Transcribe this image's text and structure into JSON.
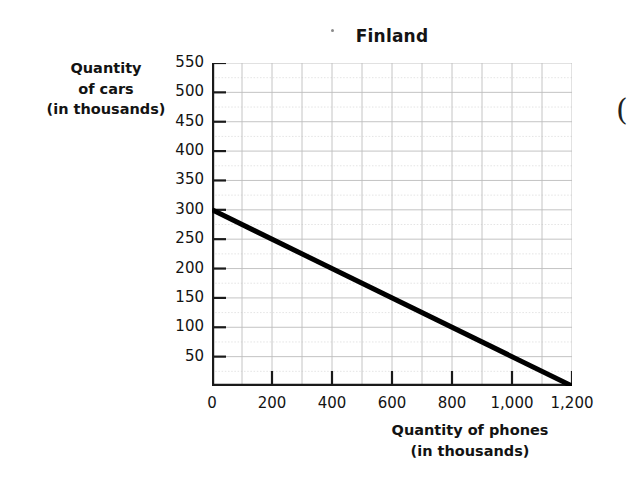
{
  "chart_data": {
    "type": "line",
    "title": "Finland",
    "xlabel": "Quantity of phones (in thousands)",
    "ylabel": "Quantity of cars (in thousands)",
    "xlabel_lines": [
      "Quantity of phones",
      "(in thousands)"
    ],
    "ylabel_lines": [
      "Quantity",
      "of cars",
      "(in thousands)"
    ],
    "xlim": [
      0,
      1200
    ],
    "ylim": [
      0,
      550
    ],
    "x_tick_values": [
      0,
      200,
      400,
      600,
      800,
      1000,
      1200
    ],
    "x_tick_labels": [
      "0",
      "200",
      "400",
      "600",
      "800",
      "1,000",
      "1,200"
    ],
    "y_tick_values": [
      50,
      100,
      150,
      200,
      250,
      300,
      350,
      400,
      450,
      500,
      550
    ],
    "y_tick_labels": [
      "50",
      "100",
      "150",
      "200",
      "250",
      "300",
      "350",
      "400",
      "450",
      "500",
      "550"
    ],
    "grid": true,
    "grid_major_x_step": 100,
    "grid_major_y_step": 50,
    "grid_minor_y_step": 25,
    "legend": null,
    "series": [
      {
        "name": "Production possibilities frontier",
        "points": [
          {
            "x": 0,
            "y": 300
          },
          {
            "x": 1200,
            "y": 0
          }
        ],
        "color": "#000000",
        "line_width": 5,
        "slope": -0.25,
        "x_intercept": 1200,
        "y_intercept": 300
      }
    ],
    "annotations": []
  },
  "artifacts": {
    "page_edge_paren": "("
  }
}
